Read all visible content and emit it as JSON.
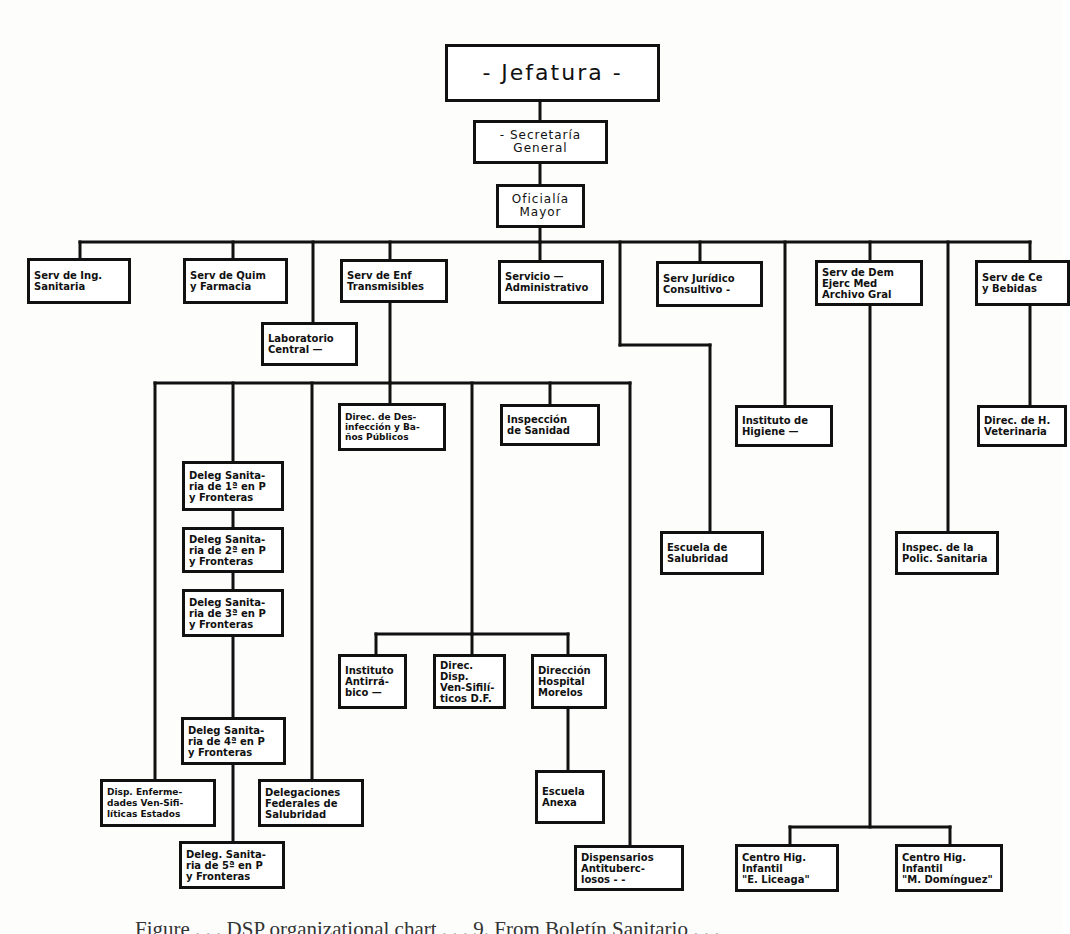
{
  "diagram": {
    "type": "organizational chart",
    "language": "Spanish",
    "nodes": {
      "jefatura": "- Jefatura -",
      "secretaria": "- Secretaría\nGeneral",
      "oficialia": "Oficialía\nMayor",
      "serv_ing": "Serv de Ing.\nSanitaria",
      "serv_quim": "Serv de Quim\ny Farmacia",
      "serv_enf": "Serv de Enf\nTransmisibles",
      "serv_admin": "Servicio —\nAdministrativo",
      "serv_juridico": "Serv Jurídico\nConsultivo -",
      "serv_dem": "Serv de Dem\nEjerc Med\nArchivo Gral",
      "serv_ce": "Serv de Ce\ny Bebidas",
      "laboratorio": "Laboratorio\nCentral —",
      "direc_desinf": "Direc. de Des-\ninfección y Ba-\nños Públicos",
      "inspeccion": "Inspección\nde Sanidad",
      "instituto_higiene": "Instituto de\nHigiene —",
      "direc_veterinaria": "Direc. de H.\nVeterinaria",
      "deleg_1": "Deleg Sanita-\nria de 1ª en P\ny Fronteras",
      "deleg_2": "Deleg Sanita-\nria de 2ª en P\ny Fronteras",
      "deleg_3": "Deleg Sanita-\nria de 3ª en P\ny Fronteras",
      "deleg_4": "Deleg Sanita-\nria de 4ª en P\ny Fronteras",
      "deleg_5": "Deleg. Sanita-\nria de 5ª en P\ny Fronteras",
      "escuela_salubridad": "Escuela de\nSalubridad",
      "inspec_policia": "Inspec. de la\nPolic. Sanitaria",
      "instituto_antirrabico": "Instituto\nAntirrá-\nbico —",
      "direc_dispensarios_vs": "Direc. Disp.\nVen-Sifilí-\nticos D.F.",
      "direccion_hospital": "Dirección\nHospital\nMorelos",
      "escuela_anexa": "Escuela\nAnexa",
      "disp_enf_estados": "Disp. Enferme-\ndades Ven-Sifi-\nlíticas Estados",
      "delegaciones_federales": "Delegaciones\nFederales de\nSalubridad",
      "dispensarios_antituberc": "Dispensarios\nAntituberc-\nlosos - -",
      "centro_liceaga": "Centro Hig.\nInfantil\n\"E. Liceaga\"",
      "centro_dominguez": "Centro Hig.\nInfantil\n\"M. Domínguez\""
    },
    "caption": "Figure . . .  DSP organizational chart . . .  9.  From Boletín Sanitario . . ."
  }
}
